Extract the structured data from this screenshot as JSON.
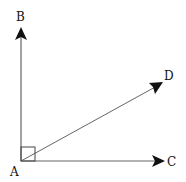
{
  "diagram": {
    "type": "geometry-angles",
    "points": {
      "A": {
        "label": "A",
        "x": 21,
        "y": 161
      },
      "B": {
        "label": "B",
        "x": 21,
        "y": 28
      },
      "C": {
        "label": "C",
        "x": 164,
        "y": 161
      },
      "D": {
        "label": "D",
        "x": 162,
        "y": 83
      }
    },
    "rays": [
      {
        "from": "A",
        "to": "B"
      },
      {
        "from": "A",
        "to": "C"
      },
      {
        "from": "A",
        "to": "D"
      }
    ],
    "right_angle_marker": {
      "vertex": "A",
      "between": [
        "B",
        "C"
      ],
      "size": 14
    },
    "colors": {
      "line": "#555555",
      "arrow": "#111111",
      "text": "#111111"
    }
  }
}
